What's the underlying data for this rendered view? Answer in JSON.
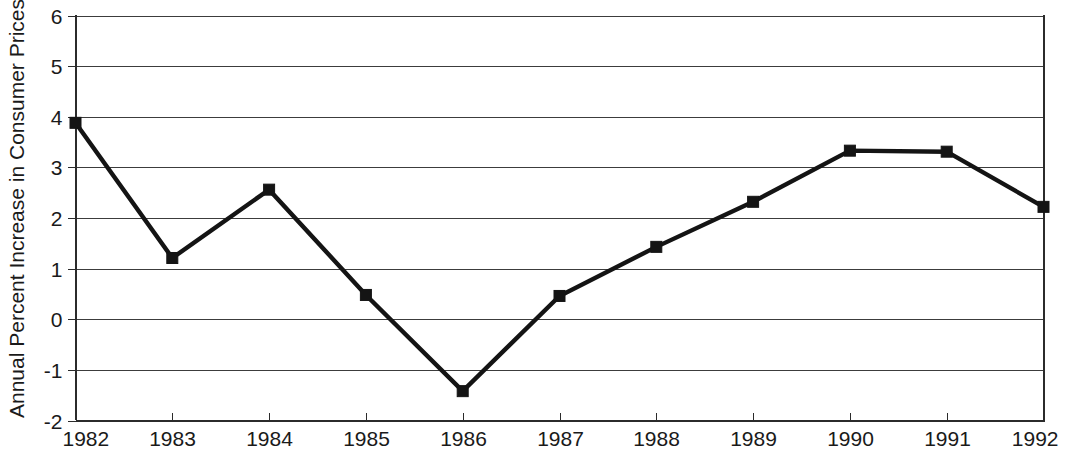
{
  "chart_data": {
    "type": "line",
    "title": "",
    "subtitle": "",
    "xlabel": "",
    "ylabel": "Annual Percent Increase in Consumer Prices",
    "x": [
      1982,
      1983,
      1984,
      1985,
      1986,
      1987,
      1988,
      1989,
      1990,
      1991,
      1992
    ],
    "categories": [
      "1982",
      "1983",
      "1984",
      "1985",
      "1986",
      "1987",
      "1988",
      "1989",
      "1990",
      "1991",
      "1992"
    ],
    "values": [
      3.88,
      1.21,
      2.56,
      0.48,
      -1.42,
      0.46,
      1.43,
      2.32,
      3.33,
      3.31,
      2.22
    ],
    "series": [
      {
        "name": "Annual Percent Increase in Consumer Prices",
        "values": [
          3.88,
          1.21,
          2.56,
          0.48,
          -1.42,
          0.46,
          1.43,
          2.32,
          3.33,
          3.31,
          2.22
        ]
      }
    ],
    "xlim": [
      1982,
      1992
    ],
    "ylim": [
      -2,
      6
    ],
    "ytick_labels": [
      "6",
      "5",
      "4",
      "3",
      "2",
      "1",
      "0",
      "-1",
      "-2"
    ],
    "ytick_values": [
      6,
      5,
      4,
      3,
      2,
      1,
      0,
      -1,
      -2
    ],
    "xtick_labels": [
      "1982",
      "1983",
      "1984",
      "1985",
      "1986",
      "1987",
      "1988",
      "1989",
      "1990",
      "1991",
      "1992"
    ],
    "grid": true,
    "grid_axis": "y",
    "legend": false,
    "legend_position": "none",
    "marker": "square",
    "line_color": "#141414",
    "marker_color": "#141414",
    "grid_color": "#3c3c3c",
    "background_color": "#ffffff",
    "annotations": []
  }
}
